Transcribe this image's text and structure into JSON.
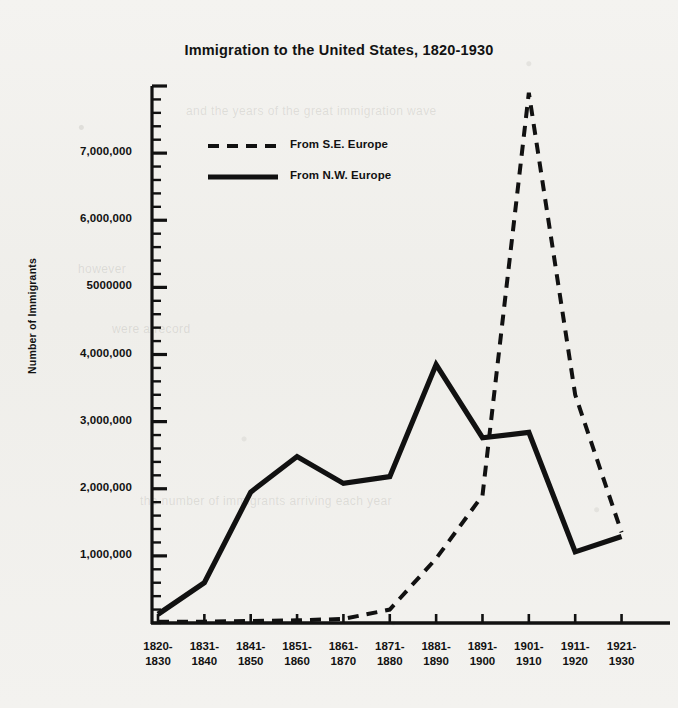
{
  "chart_data": {
    "type": "line",
    "title": "Immigration to the United States, 1820-1930",
    "xlabel": "",
    "ylabel": "Number of Immigrants",
    "categories": [
      "1820-\n1830",
      "1831-\n1840",
      "1841-\n1850",
      "1851-\n1860",
      "1861-\n1870",
      "1871-\n1880",
      "1881-\n1890",
      "1891-\n1900",
      "1901-\n1910",
      "1911-\n1920",
      "1921-\n1930"
    ],
    "category_lines": [
      [
        "1820-",
        "1830"
      ],
      [
        "1831-",
        "1840"
      ],
      [
        "1841-",
        "1850"
      ],
      [
        "1851-",
        "1860"
      ],
      [
        "1861-",
        "1870"
      ],
      [
        "1871-",
        "1880"
      ],
      [
        "1881-",
        "1890"
      ],
      [
        "1891-",
        "1900"
      ],
      [
        "1901-",
        "1910"
      ],
      [
        "1911-",
        "1920"
      ],
      [
        "1921-",
        "1930"
      ]
    ],
    "ylim": [
      0,
      8000000
    ],
    "ytick_values": [
      1000000,
      2000000,
      3000000,
      4000000,
      5000000,
      6000000,
      7000000
    ],
    "ytick_labels": [
      "1,000,000",
      "2,000,000",
      "3,000,000",
      "4,000,000",
      "5000000",
      "6,000,000",
      "7,000,000"
    ],
    "y_minor_tick_interval": 200000,
    "grid": false,
    "legend_position": "upper-left-inside",
    "series": [
      {
        "name": "From S.E. Europe",
        "style": "dashed",
        "color": "#111111",
        "values": [
          20000,
          20000,
          30000,
          40000,
          60000,
          200000,
          960000,
          1900000,
          7900000,
          3400000,
          1350000
        ]
      },
      {
        "name": "From N.W. Europe",
        "style": "solid",
        "color": "#111111",
        "values": [
          130000,
          600000,
          1950000,
          2480000,
          2080000,
          2180000,
          3850000,
          2760000,
          2840000,
          1060000,
          1290000
        ]
      }
    ]
  },
  "legend": {
    "items": [
      {
        "label": "From S.E. Europe",
        "style": "dashed"
      },
      {
        "label": "From N.W. Europe",
        "style": "solid"
      }
    ]
  },
  "axes": {
    "y_title": "Number of Immigrants"
  },
  "bleed_through": [
    "and the years of the great immigration wave",
    "however",
    "were a record",
    "the number of immigrants arriving each year"
  ],
  "colors": {
    "ink": "#111111",
    "paper": "#f2f1ee"
  }
}
